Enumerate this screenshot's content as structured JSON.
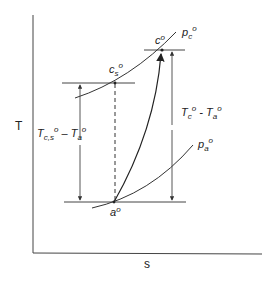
{
  "diagram": {
    "type": "T-s diagram (compressor process)",
    "axes": {
      "y_label": "T",
      "x_label": "s"
    },
    "curves": {
      "high_pressure": {
        "label_main": "p",
        "label_sub": "c",
        "label_sup": "o"
      },
      "low_pressure": {
        "label_main": "p",
        "label_sub": "a",
        "label_sup": "o"
      }
    },
    "points": {
      "actual_exit": {
        "label_main": "c",
        "label_sup": "o"
      },
      "isentropic_exit": {
        "label_main": "c",
        "label_sub": "s",
        "label_sup": "o"
      },
      "inlet": {
        "label_main": "a",
        "label_sup": "o"
      }
    },
    "dimensions": {
      "isentropic_rise": {
        "text_T1": "T",
        "text_sub1": "c,s",
        "text_sup1": "o",
        "text_minus": " – ",
        "text_T2": "T",
        "text_sub2": "a",
        "text_sup2": "o"
      },
      "actual_rise": {
        "text_T1": "T",
        "text_sub1": "c",
        "text_sup1": "o",
        "text_minus": " - ",
        "text_T2": "T",
        "text_sub2": "a",
        "text_sup2": "o"
      }
    },
    "colors": {
      "line": "#333333",
      "background": "#ffffff"
    }
  }
}
